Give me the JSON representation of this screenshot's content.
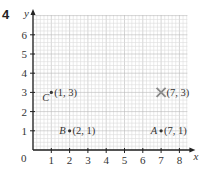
{
  "question_number": "4",
  "chart_data": {
    "type": "scatter",
    "title": "",
    "xlabel": "x",
    "ylabel": "y",
    "xlim": [
      0,
      8
    ],
    "ylim": [
      0,
      6
    ],
    "x_ticks": [
      "1",
      "2",
      "3",
      "4",
      "5",
      "6",
      "7",
      "8"
    ],
    "y_ticks": [
      "1",
      "2",
      "3",
      "4",
      "5",
      "6"
    ],
    "origin_label": "0",
    "grid": true,
    "points": [
      {
        "name": "A",
        "x": 7,
        "y": 1,
        "label": "(7, 1)",
        "marker": "dot",
        "name_side": "left"
      },
      {
        "name": "B",
        "x": 2,
        "y": 1,
        "label": "(2, 1)",
        "marker": "dot",
        "name_side": "left"
      },
      {
        "name": "C",
        "x": 1,
        "y": 3,
        "label": "(1, 3)",
        "marker": "dot",
        "name_side": "below-left"
      },
      {
        "name": "",
        "x": 7,
        "y": 3,
        "label": "(7, 3)",
        "marker": "cross"
      }
    ]
  },
  "colors": {
    "grid_minor": "#dcdcdc",
    "grid_major": "#b8b8b8",
    "axis": "#222222",
    "cross": "#888888"
  }
}
